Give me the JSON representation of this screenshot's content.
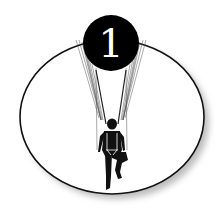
{
  "badge": {
    "number": "1",
    "background_color": "#000000",
    "text_color": "#ffffff"
  },
  "illustration": {
    "subject": "parachutist-descending",
    "frame_shape": "ellipse",
    "frame_fill": "#ffffff",
    "frame_stroke": "#111111"
  }
}
